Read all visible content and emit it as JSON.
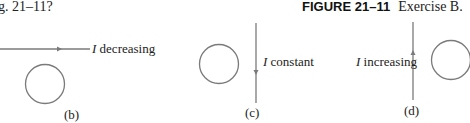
{
  "question_fragment": "g. 21–11?",
  "figure": {
    "number": "FIGURE 21–11",
    "description": "Exercise B."
  },
  "colors": {
    "line": "#7a7a7a",
    "text": "#222222"
  },
  "panels": [
    {
      "id": "b",
      "label": "(b)",
      "current_symbol": "I",
      "current_state": "decreasing",
      "wire": "horizontal",
      "arrow": "right"
    },
    {
      "id": "c",
      "label": "(c)",
      "current_symbol": "I",
      "current_state": "constant",
      "wire": "vertical",
      "arrow": "down"
    },
    {
      "id": "d",
      "label": "(d)",
      "current_symbol": "I",
      "current_state": "increasing",
      "wire": "vertical",
      "arrow": "up"
    }
  ]
}
